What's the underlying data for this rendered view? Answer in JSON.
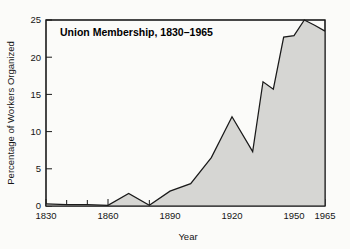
{
  "chart_data": {
    "type": "area",
    "title": "Union Membership, 1830–1965",
    "xlabel": "Year",
    "ylabel": "Percentage of Workers Organized",
    "xlim": [
      1830,
      1965
    ],
    "ylim": [
      0,
      25
    ],
    "grid": false,
    "legend": null,
    "x_ticks_major": [
      1830,
      1860,
      1890,
      1920,
      1950,
      1965
    ],
    "x_tick_labels": [
      "1830",
      "1860",
      "1890",
      "1920",
      "1950",
      "1965"
    ],
    "x_ticks_minor": [
      1840,
      1850,
      1870,
      1880,
      1900,
      1910,
      1930,
      1940,
      1960
    ],
    "y_ticks": [
      0,
      5,
      10,
      15,
      20,
      25
    ],
    "y_tick_labels": [
      "0",
      "5",
      "10",
      "15",
      "20",
      "25"
    ],
    "series": [
      {
        "name": "Percentage of Workers Organized",
        "fill_color": "#d6d6d3",
        "line_color": "#1a1a1a",
        "x": [
          1830,
          1840,
          1850,
          1860,
          1870,
          1880,
          1890,
          1900,
          1910,
          1920,
          1930,
          1935,
          1940,
          1945,
          1950,
          1955,
          1960,
          1965
        ],
        "values": [
          0.3,
          0.2,
          0.2,
          0.1,
          1.7,
          0.1,
          2.0,
          3.0,
          6.5,
          12.0,
          7.3,
          16.7,
          15.7,
          22.7,
          22.9,
          25.0,
          24.3,
          23.5
        ]
      }
    ],
    "annotations": []
  },
  "colors": {
    "background": "#fbfbf9",
    "axis": "#1a1a1a",
    "fill": "#d6d6d3",
    "text": "#151515"
  }
}
